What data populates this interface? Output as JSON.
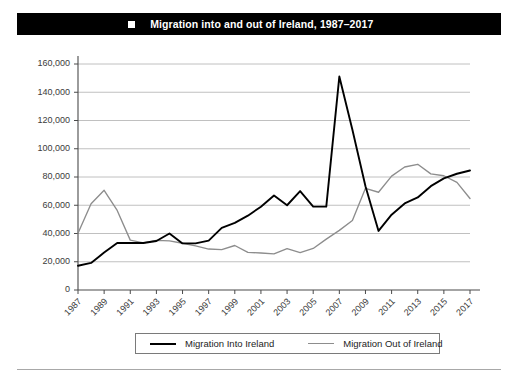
{
  "figure": {
    "number": "FIGURE 2.5",
    "bullet_icon": "square-bullet-icon",
    "title": "Migration into and out of Ireland, 1987–2017"
  },
  "legend": {
    "into_label": "Migration Into Ireland",
    "out_label": "Migration Out of Ireland"
  },
  "colors": {
    "into_series": "#000000",
    "out_series": "#8d8d8d",
    "header_background": "#000000",
    "header_text": "#ffffff",
    "gridline": "#b9b9b9",
    "axis": "#4a4a4a"
  },
  "chart_data": {
    "type": "line",
    "title": "Migration into and out of Ireland, 1987–2017",
    "xlabel": "",
    "ylabel": "",
    "ylim": [
      0,
      160000
    ],
    "ytick_labels": [
      "0",
      "20,000",
      "40,000",
      "60,000",
      "80,000",
      "100,000",
      "120,000",
      "140,000",
      "160,000"
    ],
    "ytick_values": [
      0,
      20000,
      40000,
      60000,
      80000,
      100000,
      120000,
      140000,
      160000
    ],
    "grid": true,
    "legend_position": "bottom",
    "x": [
      1987,
      1988,
      1989,
      1990,
      1991,
      1992,
      1993,
      1994,
      1995,
      1996,
      1997,
      1998,
      1999,
      2000,
      2001,
      2002,
      2003,
      2004,
      2005,
      2006,
      2007,
      2008,
      2009,
      2010,
      2011,
      2012,
      2013,
      2014,
      2015,
      2016,
      2017
    ],
    "xtick_labels": [
      "1987",
      "1989",
      "1991",
      "1993",
      "1995",
      "1997",
      "1999",
      "2001",
      "2003",
      "2005",
      "2007",
      "2009",
      "2011",
      "2013",
      "2015",
      "2017"
    ],
    "xtick_values": [
      1987,
      1989,
      1991,
      1993,
      1995,
      1997,
      1999,
      2001,
      2003,
      2005,
      2007,
      2009,
      2011,
      2013,
      2015,
      2017
    ],
    "series": [
      {
        "name": "Migration Into Ireland",
        "color": "#000000",
        "values": [
          17200,
          19200,
          26500,
          33300,
          33300,
          33300,
          34700,
          40000,
          33000,
          33000,
          35000,
          44000,
          47500,
          52600,
          59000,
          66900,
          60000,
          70000,
          59000,
          59000,
          151100,
          113500,
          73500,
          41800,
          53300,
          61300,
          65500,
          73500,
          79000,
          82300,
          84600
        ],
        "marker": "none"
      },
      {
        "name": "Migration Out of Ireland",
        "color": "#8d8d8d",
        "values": [
          40200,
          61100,
          70600,
          56300,
          35300,
          33400,
          35100,
          34800,
          33100,
          31200,
          29000,
          28600,
          31500,
          26600,
          26200,
          25600,
          29300,
          26500,
          29400,
          36000,
          42200,
          49200,
          72000,
          69200,
          80600,
          87100,
          89000,
          82200,
          80900,
          76200,
          64800
        ],
        "marker": "none"
      }
    ]
  }
}
